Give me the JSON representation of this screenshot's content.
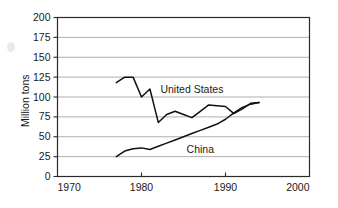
{
  "chart_data": {
    "type": "line",
    "title": "",
    "xlabel": "",
    "ylabel": "Million tons",
    "xlim": [
      1970,
      2000
    ],
    "ylim": [
      0,
      200
    ],
    "grid": true,
    "grid_axis": "y",
    "legend_position": "inline-annotation",
    "xticks": [
      1970,
      1980,
      1990,
      2000
    ],
    "xtick_labels": [
      "1970",
      "1980",
      "1990",
      "2000"
    ],
    "yticks": [
      0,
      25,
      50,
      75,
      100,
      125,
      150,
      175,
      200
    ],
    "ytick_labels": [
      "0",
      "25",
      "50",
      "75",
      "100",
      "125",
      "150",
      "175",
      "200"
    ],
    "series": [
      {
        "name": "United States",
        "label_x": 1986.0,
        "label_y": 110,
        "x": [
          1977,
          1978,
          1979,
          1980,
          1981,
          1982,
          1983,
          1984,
          1985,
          1986,
          1987,
          1988,
          1989,
          1990,
          1991,
          1992,
          1993,
          1994
        ],
        "values": [
          118,
          125,
          125,
          100,
          110,
          68,
          78,
          82,
          78,
          74,
          82,
          90,
          89,
          88,
          79,
          85,
          92,
          93
        ]
      },
      {
        "name": "China",
        "label_x": 1987.0,
        "label_y": 34,
        "x": [
          1977,
          1978,
          1979,
          1980,
          1981,
          1982,
          1983,
          1984,
          1985,
          1986,
          1987,
          1988,
          1989,
          1990,
          1991,
          1992,
          1993,
          1994
        ],
        "values": [
          25,
          32,
          35,
          36,
          34,
          38,
          42,
          46,
          50,
          54,
          58,
          62,
          66,
          72,
          80,
          87,
          91,
          93
        ]
      }
    ],
    "colors": {
      "line": "#111111",
      "grid": "#9a9a9a",
      "frame": "#2a2a2a",
      "text": "#1a1a1a",
      "background": "#ffffff"
    }
  }
}
